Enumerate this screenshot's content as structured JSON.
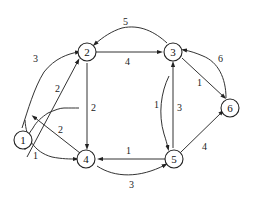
{
  "graph": {
    "type": "directed-weighted",
    "nodes": [
      {
        "id": "1",
        "label": "1"
      },
      {
        "id": "2",
        "label": "2"
      },
      {
        "id": "3",
        "label": "3"
      },
      {
        "id": "4",
        "label": "4"
      },
      {
        "id": "5",
        "label": "5"
      },
      {
        "id": "6",
        "label": "6"
      }
    ],
    "edges": [
      {
        "from": "1",
        "to": "2",
        "weight": "3",
        "style": "curved-outer"
      },
      {
        "from": "1",
        "to": "2",
        "weight": "2",
        "style": "straight"
      },
      {
        "from": "3",
        "to": "2",
        "weight": "5",
        "style": "curved-top"
      },
      {
        "from": "2",
        "to": "3",
        "weight": "4",
        "style": "straight"
      },
      {
        "from": "2",
        "to": "4",
        "weight": "2",
        "style": "straight"
      },
      {
        "from": "4",
        "to": "1",
        "weight": "2",
        "style": "straight"
      },
      {
        "from": "1",
        "to": "4",
        "weight": "1",
        "style": "curved"
      },
      {
        "from": "5",
        "to": "4",
        "weight": "1",
        "style": "straight"
      },
      {
        "from": "4",
        "to": "5",
        "weight": "3",
        "style": "curved-bottom"
      },
      {
        "from": "3",
        "to": "5",
        "weight": "1",
        "style": "curved"
      },
      {
        "from": "5",
        "to": "3",
        "weight": "3",
        "style": "straight"
      },
      {
        "from": "3",
        "to": "6",
        "weight": "1",
        "style": "straight"
      },
      {
        "from": "6",
        "to": "3",
        "weight": "6",
        "style": "curved"
      },
      {
        "from": "5",
        "to": "6",
        "weight": "4",
        "style": "straight"
      }
    ]
  }
}
